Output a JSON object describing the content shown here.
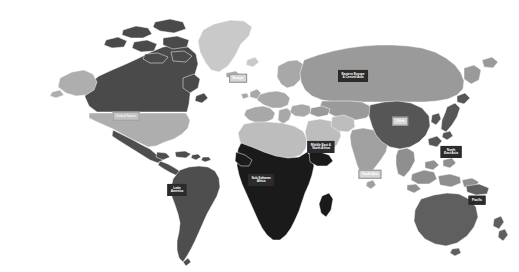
{
  "map": {
    "title": "World map of development regions",
    "background_color": "#ffffff",
    "border_color": "#ffffff",
    "projection": "equirectangular",
    "type": "choropleth-grayscale",
    "regions": [
      {
        "id": "canada",
        "name": "Canada",
        "color": "#4a4a4a"
      },
      {
        "id": "united-states",
        "name": "United States",
        "color": "#aeaeae"
      },
      {
        "id": "greenland",
        "name": "Greenland",
        "color": "#c9c9c9"
      },
      {
        "id": "latin-america",
        "name": "Latin America",
        "color": "#4e4e4e"
      },
      {
        "id": "europe",
        "name": "Europe",
        "color": "#a8a8a8"
      },
      {
        "id": "eeca",
        "name": "Eastern Europe & Central Asia",
        "color": "#9a9a9a"
      },
      {
        "id": "mena",
        "name": "Middle East & North Africa",
        "color": "#bdbdbd"
      },
      {
        "id": "ssa",
        "name": "Sub-Saharan Africa",
        "color": "#1a1a1a"
      },
      {
        "id": "south-asia",
        "name": "South Asia",
        "color": "#a0a0a0"
      },
      {
        "id": "china",
        "name": "China",
        "color": "#565656"
      },
      {
        "id": "nea",
        "name": "North East Asia",
        "color": "#565656"
      },
      {
        "id": "sea",
        "name": "South East Asia",
        "color": "#8f8f8f"
      },
      {
        "id": "pacific",
        "name": "Pacific",
        "color": "#5f5f5f"
      }
    ],
    "labels": [
      {
        "id": "united-states",
        "lines": [
          "United States"
        ],
        "style": "pale",
        "x": 126,
        "y": 116
      },
      {
        "id": "latin-america",
        "lines": [
          "Latin",
          "America"
        ],
        "style": "dark",
        "x": 177,
        "y": 190
      },
      {
        "id": "europe",
        "lines": [
          "Europe"
        ],
        "style": "light",
        "x": 238,
        "y": 78
      },
      {
        "id": "eeca",
        "lines": [
          "Eastern Europe",
          "& Central Asia"
        ],
        "style": "dark",
        "x": 353,
        "y": 76
      },
      {
        "id": "mena",
        "lines": [
          "Middle East &",
          "North Africa"
        ],
        "style": "dark",
        "x": 321,
        "y": 147
      },
      {
        "id": "ssa",
        "lines": [
          "Sub-Saharan",
          "Africa"
        ],
        "style": "dark",
        "x": 261,
        "y": 180
      },
      {
        "id": "south-asia",
        "lines": [
          "South Asia"
        ],
        "style": "light",
        "x": 370,
        "y": 174
      },
      {
        "id": "china",
        "lines": [
          "China"
        ],
        "style": "light",
        "x": 400,
        "y": 121
      },
      {
        "id": "nea",
        "lines": [
          "North",
          "East Asia"
        ],
        "style": "dark",
        "x": 451,
        "y": 152
      },
      {
        "id": "pacific",
        "lines": [
          "Pacific"
        ],
        "style": "dark",
        "x": 477,
        "y": 200
      }
    ]
  }
}
